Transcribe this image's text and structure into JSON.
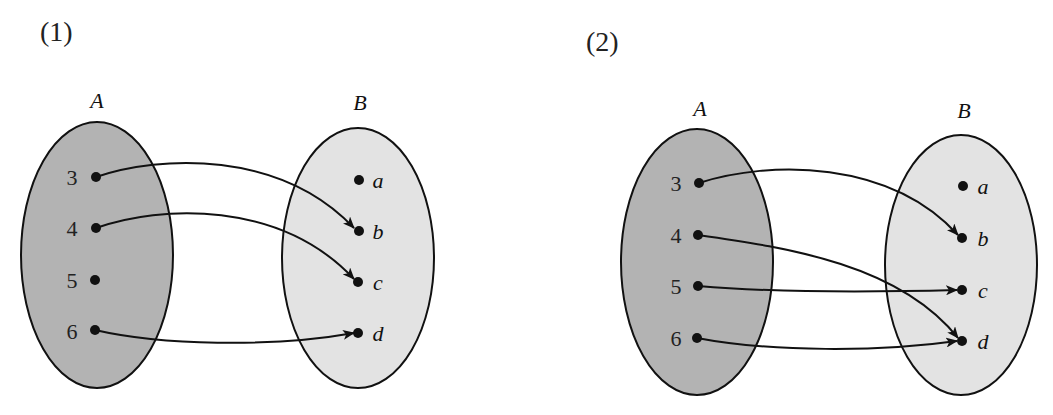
{
  "colors": {
    "set_a_fill": "#b3b3b3",
    "set_b_fill": "#e3e3e3",
    "stroke": "#111111",
    "background": "#ffffff"
  },
  "diagrams": [
    {
      "label": "(1)",
      "set_a": {
        "name": "A",
        "elements": [
          "3",
          "4",
          "5",
          "6"
        ]
      },
      "set_b": {
        "name": "B",
        "elements": [
          "a",
          "b",
          "c",
          "d"
        ]
      },
      "mappings": [
        {
          "from": "3",
          "to": "b"
        },
        {
          "from": "4",
          "to": "c"
        },
        {
          "from": "6",
          "to": "d"
        }
      ]
    },
    {
      "label": "(2)",
      "set_a": {
        "name": "A",
        "elements": [
          "3",
          "4",
          "5",
          "6"
        ]
      },
      "set_b": {
        "name": "B",
        "elements": [
          "a",
          "b",
          "c",
          "d"
        ]
      },
      "mappings": [
        {
          "from": "3",
          "to": "b"
        },
        {
          "from": "4",
          "to": "d"
        },
        {
          "from": "5",
          "to": "c"
        },
        {
          "from": "6",
          "to": "d"
        }
      ]
    }
  ]
}
